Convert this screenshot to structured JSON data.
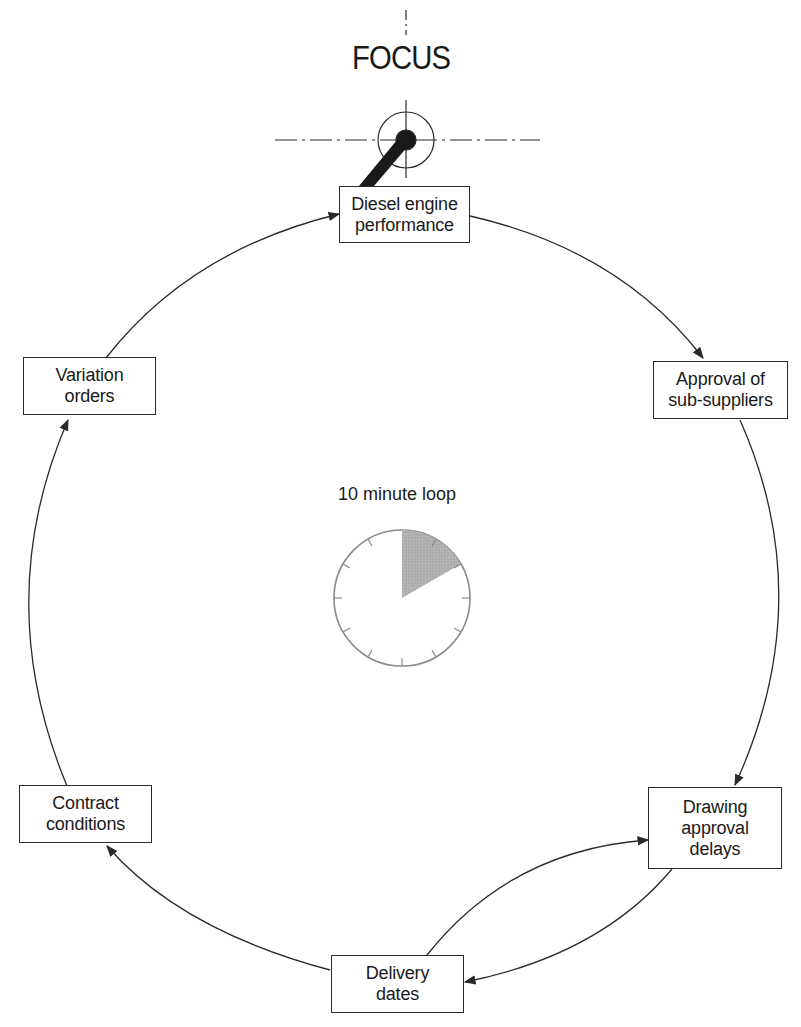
{
  "diagram": {
    "focus_label": "FOCUS",
    "loop_label": "10 minute loop",
    "nodes": [
      {
        "id": "diesel",
        "lines": [
          "Diesel engine",
          "performance"
        ]
      },
      {
        "id": "approval",
        "lines": [
          "Approval of",
          "sub-suppliers"
        ]
      },
      {
        "id": "drawing",
        "lines": [
          "Drawing",
          "approval",
          "delays"
        ]
      },
      {
        "id": "delivery",
        "lines": [
          "Delivery",
          "dates"
        ]
      },
      {
        "id": "contract",
        "lines": [
          "Contract",
          "conditions"
        ]
      },
      {
        "id": "variation",
        "lines": [
          "Variation",
          "orders"
        ]
      }
    ],
    "edges": [
      {
        "from": "diesel",
        "to": "approval"
      },
      {
        "from": "approval",
        "to": "drawing"
      },
      {
        "from": "drawing",
        "to": "delivery"
      },
      {
        "from": "delivery",
        "to": "drawing"
      },
      {
        "from": "delivery",
        "to": "contract"
      },
      {
        "from": "contract",
        "to": "variation"
      },
      {
        "from": "variation",
        "to": "diesel"
      }
    ],
    "clock": {
      "ticks": 12,
      "shaded_from_tick": 0,
      "shaded_to_tick": 2,
      "shade_color": "#a8a8a8"
    },
    "line_color": "#2a2a2a"
  }
}
